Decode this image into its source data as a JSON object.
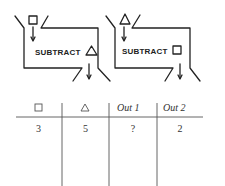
{
  "machines": [
    {
      "input_symbol": "square",
      "operation_label": "SUBTRACT",
      "operand_symbol": "triangle"
    },
    {
      "input_symbol": "triangle",
      "operation_label": "SUBTRACT",
      "operand_symbol": "square"
    }
  ],
  "table": {
    "headers": [
      {
        "type": "symbol",
        "symbol": "square",
        "text": ""
      },
      {
        "type": "symbol",
        "symbol": "triangle",
        "text": ""
      },
      {
        "type": "text",
        "text": "Out 1"
      },
      {
        "type": "text",
        "text": "Out 2"
      }
    ],
    "rows": [
      [
        "3",
        "5",
        "?",
        "2"
      ]
    ]
  }
}
